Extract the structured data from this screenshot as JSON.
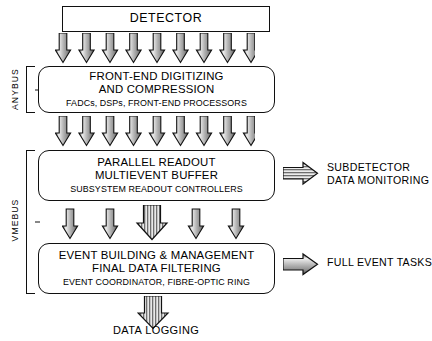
{
  "diagram": {
    "colors": {
      "outline": "#101010",
      "background": "#ffffff",
      "arrow_light": "#f2f2f2",
      "arrow_mid": "#a8a8a8",
      "arrow_dark": "#4a4a4a"
    }
  },
  "boxes": {
    "detector": {
      "line1": "DETECTOR"
    },
    "frontend": {
      "line1": "FRONT-END DIGITIZING",
      "line2": "AND COMPRESSION",
      "subtitle": "FADCs, DSPs, FRONT-END PROCESSORS"
    },
    "readout": {
      "line1": "PARALLEL READOUT",
      "line2": "MULTIEVENT BUFFER",
      "subtitle": "SUBSYSTEM READOUT CONTROLLERS"
    },
    "eventbuilding": {
      "line1": "EVENT BUILDING & MANAGEMENT",
      "line2": "FINAL DATA FILTERING",
      "subtitle": "EVENT COORDINATOR, FIBRE-OPTIC RING"
    }
  },
  "buses": [
    {
      "label": "ANYBUS"
    },
    {
      "label": "VMEBUS"
    }
  ],
  "captions": {
    "subdetector": {
      "line1": "SUBDETECTOR",
      "line2": "DATA MONITORING"
    },
    "full_event_tasks": {
      "line1": "FULL EVENT TASKS"
    },
    "data_logging": {
      "line1": "DATA LOGGING"
    }
  },
  "arrow_groups": {
    "detector_to_frontend": {
      "count": 9,
      "style": "thin-gradient"
    },
    "frontend_to_readout": {
      "count": 9,
      "style": "thin-gradient"
    },
    "readout_to_eventbuilding": {
      "count": 5,
      "style": "mixed-thin-and-wide-striped"
    },
    "eventbuilding_to_logging": {
      "count": 1,
      "style": "wide-striped"
    },
    "readout_to_subdetector": {
      "count": 1,
      "style": "right-striped"
    },
    "eventbuilding_to_fulleventtasks": {
      "count": 1,
      "style": "right-gradient"
    }
  }
}
